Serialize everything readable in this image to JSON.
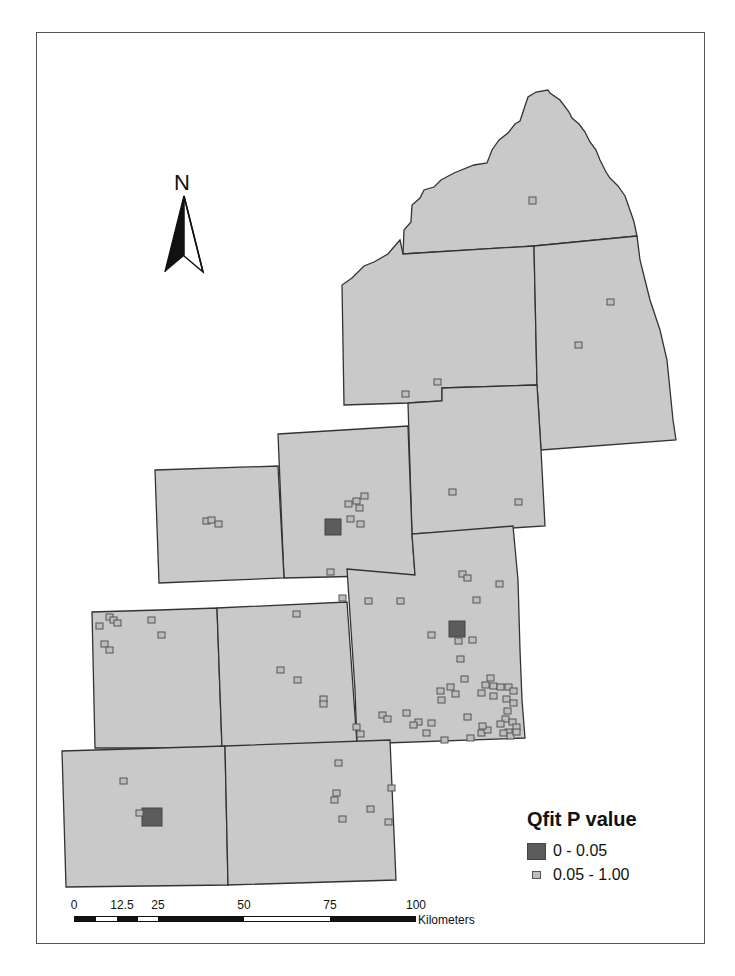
{
  "map": {
    "north_arrow": {
      "label": "N"
    },
    "legend": {
      "title": "Qfit P value",
      "items": [
        {
          "label": "0 - 0.05",
          "symbol": "large-dark-square",
          "color": "#5c5c5c"
        },
        {
          "label": "0.05 - 1.00",
          "symbol": "small-light-square",
          "color": "#bdbdbd"
        }
      ]
    },
    "scale_bar": {
      "ticks": [
        "0",
        "12.5",
        "25",
        "50",
        "75",
        "100"
      ],
      "unit": "Kilometers"
    },
    "colors": {
      "county_fill": "#c9c9c9",
      "county_stroke": "#333333",
      "significant_marker": "#5c5c5c",
      "nonsignificant_marker": "#bdbdbd"
    }
  }
}
